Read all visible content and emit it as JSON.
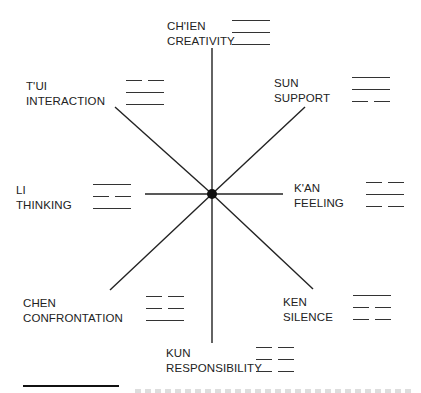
{
  "diagram": {
    "center": {
      "x": 212,
      "y": 194
    },
    "spokes": [
      {
        "direction": "N",
        "x2": 212,
        "y2": 48
      },
      {
        "direction": "S",
        "x2": 212,
        "y2": 343
      },
      {
        "direction": "W",
        "x2": 145,
        "y2": 194
      },
      {
        "direction": "E",
        "x2": 283,
        "y2": 194
      },
      {
        "direction": "NW",
        "x2": 115,
        "y2": 107
      },
      {
        "direction": "NE",
        "x2": 305,
        "y2": 107
      },
      {
        "direction": "SW",
        "x2": 110,
        "y2": 290
      },
      {
        "direction": "SE",
        "x2": 313,
        "y2": 289
      }
    ],
    "trigrams": [
      {
        "id": "chien",
        "name": "CH'IEN",
        "meaning": "CREATIVITY",
        "lines": [
          "solid",
          "solid",
          "solid"
        ]
      },
      {
        "id": "tui",
        "name": "T'UI",
        "meaning": "INTERACTION",
        "lines": [
          "broken",
          "solid",
          "solid"
        ]
      },
      {
        "id": "sun",
        "name": "SUN",
        "meaning": "SUPPORT",
        "lines": [
          "solid",
          "solid",
          "broken"
        ]
      },
      {
        "id": "li",
        "name": "LI",
        "meaning": "THINKING",
        "lines": [
          "solid",
          "broken",
          "solid"
        ]
      },
      {
        "id": "kan",
        "name": "K'AN",
        "meaning": "FEELING",
        "lines": [
          "broken",
          "solid",
          "broken"
        ]
      },
      {
        "id": "chen",
        "name": "CHEN",
        "meaning": "CONFRONTATION",
        "lines": [
          "broken",
          "broken",
          "solid"
        ]
      },
      {
        "id": "ken",
        "name": "KEN",
        "meaning": "SILENCE",
        "lines": [
          "solid",
          "broken",
          "broken"
        ]
      },
      {
        "id": "kun",
        "name": "KUN",
        "meaning": "RESPONSIBILITY",
        "lines": [
          "broken",
          "broken",
          "broken"
        ]
      }
    ],
    "colors": {
      "ink": "#1a1a1a",
      "background": "#ffffff"
    }
  }
}
